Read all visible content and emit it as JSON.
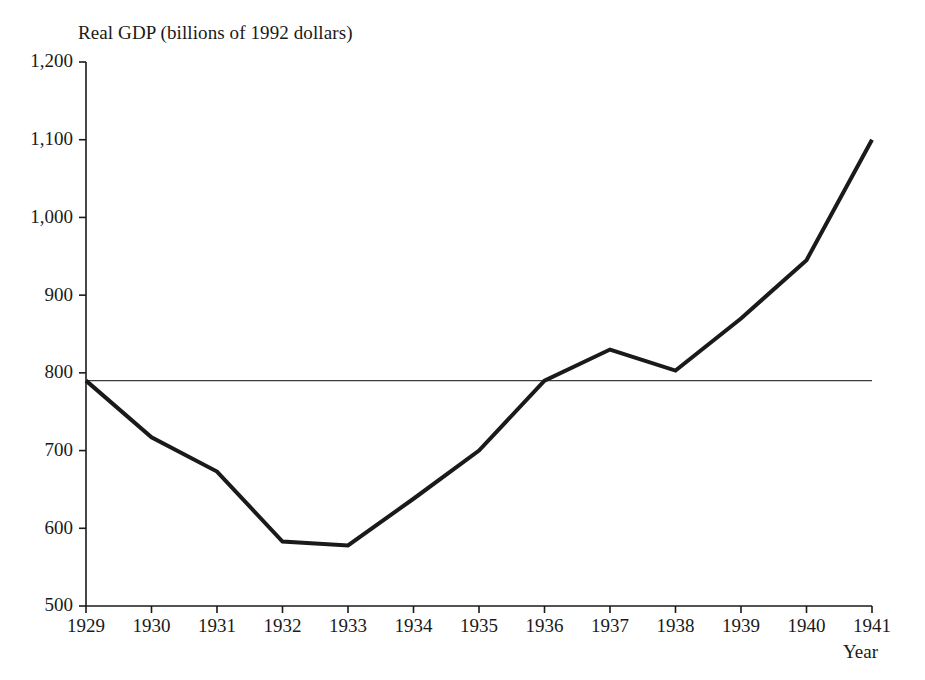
{
  "chart_data": {
    "type": "line",
    "title": "Real GDP (billions of 1992 dollars)",
    "xlabel": "Year",
    "ylabel": "",
    "categories": [
      "1929",
      "1930",
      "1931",
      "1932",
      "1933",
      "1934",
      "1935",
      "1936",
      "1937",
      "1938",
      "1939",
      "1940",
      "1941"
    ],
    "x": [
      1929,
      1930,
      1931,
      1932,
      1933,
      1934,
      1935,
      1936,
      1937,
      1938,
      1939,
      1940,
      1941
    ],
    "values": [
      790,
      717,
      673,
      583,
      578,
      638,
      700,
      790,
      830,
      803,
      870,
      945,
      1100
    ],
    "series": [
      {
        "name": "Real GDP",
        "values": [
          790,
          717,
          673,
          583,
          578,
          638,
          700,
          790,
          830,
          803,
          870,
          945,
          1100
        ]
      }
    ],
    "xlim": [
      1929,
      1941
    ],
    "ylim": [
      500,
      1200
    ],
    "ytick_labels": [
      "1,200",
      "1,100",
      "1,000",
      "900",
      "800",
      "700",
      "600",
      "500"
    ],
    "ytick_values": [
      1200,
      1100,
      1000,
      900,
      800,
      700,
      600,
      500
    ],
    "grid": false,
    "legend": "none",
    "annotations": [
      {
        "name": "reference-line",
        "type": "horizontal-line",
        "value": 790,
        "label": ""
      }
    ],
    "colors": {
      "data_line": "#1a1a1a",
      "reference_line": "#3d3d3d",
      "axis": "#1a1a1a",
      "background": "#ffffff"
    }
  }
}
